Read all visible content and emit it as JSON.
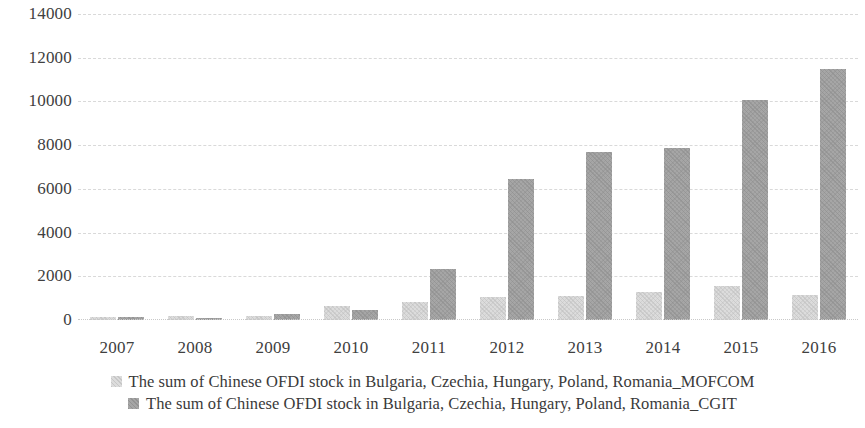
{
  "chart_data": {
    "type": "bar",
    "title": "",
    "subtitle": "",
    "xlabel": "",
    "ylabel": "",
    "categories": [
      "2007",
      "2008",
      "2009",
      "2010",
      "2011",
      "2012",
      "2013",
      "2014",
      "2015",
      "2016"
    ],
    "ylim": [
      0,
      14000
    ],
    "ytick_step": 2000,
    "yticks": [
      "14000",
      "12000",
      "10000",
      "8000",
      "6000",
      "4000",
      "2000",
      "0"
    ],
    "grid": true,
    "legend_position": "bottom",
    "series": [
      {
        "name": "The sum of Chinese OFDI stock in Bulgaria, Czechia, Hungary, Poland, Romania_MOFCOM",
        "color": "#dcdcdc",
        "values": [
          150,
          200,
          200,
          650,
          810,
          1050,
          1110,
          1260,
          1560,
          1150
        ]
      },
      {
        "name": "The sum of Chinese OFDI stock in Bulgaria, Czechia, Hungary, Poland, Romania_CGIT",
        "color": "#a6a6a6",
        "values": [
          130,
          110,
          280,
          440,
          2350,
          6450,
          7700,
          7870,
          10050,
          11480
        ]
      }
    ]
  },
  "legend": {
    "entries": [
      {
        "swatch": "legend-swatch-mofcom",
        "label": "The sum of Chinese OFDI stock in Bulgaria, Czechia, Hungary, Poland, Romania_MOFCOM"
      },
      {
        "swatch": "legend-swatch-cgit",
        "label": "The sum of Chinese OFDI stock in Bulgaria, Czechia, Hungary, Poland, Romania_CGIT"
      }
    ]
  }
}
